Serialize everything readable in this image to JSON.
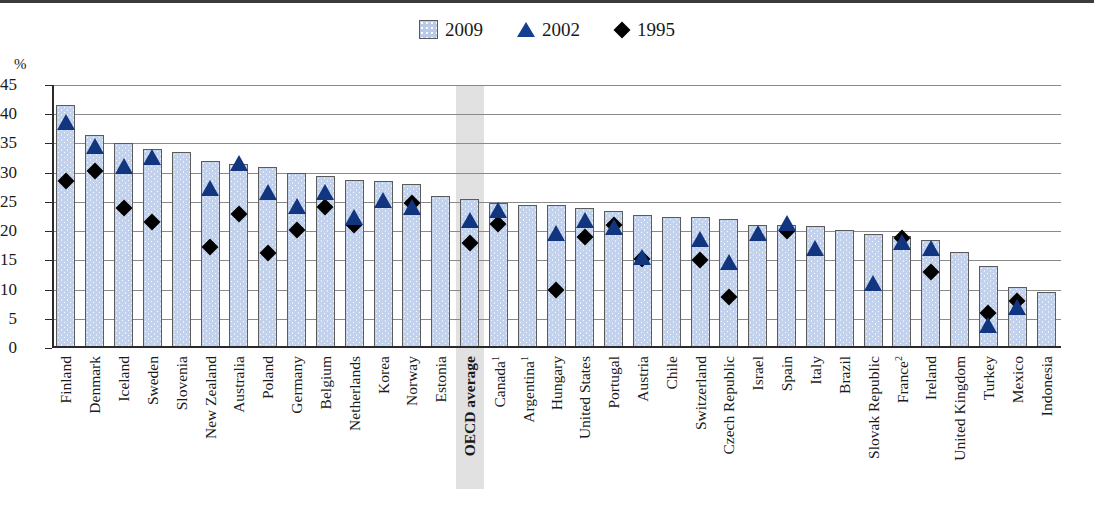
{
  "legend": {
    "items": [
      {
        "label": "2009",
        "icon": "square-swatch-icon",
        "color": "#b9c9e8"
      },
      {
        "label": "2002",
        "icon": "triangle-marker-icon",
        "color": "#11367f"
      },
      {
        "label": "1995",
        "icon": "diamond-marker-icon",
        "color": "#000000"
      }
    ]
  },
  "axis": {
    "y_unit": "%",
    "y_ticks": [
      "0",
      "5",
      "10",
      "15",
      "20",
      "25",
      "30",
      "35",
      "40",
      "45"
    ]
  },
  "highlight": {
    "category": "OECD average",
    "color": "#dcdcdc"
  },
  "chart_data": {
    "type": "bar",
    "title": "",
    "xlabel": "",
    "ylabel": "%",
    "ylim": [
      0,
      45
    ],
    "ytick_step": 5,
    "grid": true,
    "legend_position": "top-center",
    "categories": [
      "Finland",
      "Denmark",
      "Iceland",
      "Sweden",
      "Slovenia",
      "New Zealand",
      "Australia",
      "Poland",
      "Germany",
      "Belgium",
      "Netherlands",
      "Korea",
      "Norway",
      "Estonia",
      "OECD average",
      "Canada¹",
      "Argentina¹",
      "Hungary",
      "United States",
      "Portugal",
      "Austria",
      "Chile",
      "Switzerland",
      "Czech Republic",
      "Israel",
      "Spain",
      "Italy",
      "Brazil",
      "Slovak Republic",
      "France²",
      "Ireland",
      "United Kingdom",
      "Turkey",
      "Mexico",
      "Indonesia"
    ],
    "category_footnotes": {
      "Canada¹": "1",
      "Argentina¹": "1",
      "France²": "2"
    },
    "series": [
      {
        "name": "2009",
        "type": "bar",
        "color": "#c3d2ec",
        "values": [
          41.5,
          36.5,
          35.0,
          34.0,
          33.5,
          32.0,
          31.5,
          31.0,
          30.0,
          29.5,
          28.8,
          28.5,
          28.0,
          26.0,
          25.5,
          24.8,
          24.5,
          24.5,
          24.0,
          23.5,
          22.8,
          22.5,
          22.5,
          22.0,
          21.0,
          21.0,
          20.8,
          20.2,
          19.5,
          19.2,
          18.5,
          16.5,
          14.0,
          10.5,
          9.5
        ]
      },
      {
        "name": "2002",
        "type": "marker-triangle",
        "color": "#11367f",
        "values": [
          39.5,
          35.5,
          32.0,
          33.5,
          null,
          28.2,
          32.5,
          27.5,
          25.2,
          27.5,
          23.3,
          26.2,
          25.0,
          null,
          22.7,
          24.5,
          null,
          20.5,
          22.8,
          21.5,
          16.5,
          null,
          19.5,
          15.5,
          20.5,
          22.2,
          18.0,
          null,
          12.0,
          19.0,
          18.0,
          null,
          4.8,
          7.8,
          null
        ]
      },
      {
        "name": "1995",
        "type": "marker-diamond",
        "color": "#000000",
        "values": [
          28.5,
          30.2,
          24.0,
          21.5,
          null,
          17.2,
          23.0,
          16.2,
          20.2,
          24.2,
          21.0,
          null,
          24.8,
          null,
          18.0,
          21.3,
          null,
          10.0,
          19.0,
          21.0,
          15.3,
          null,
          15.0,
          8.8,
          null,
          20.0,
          null,
          null,
          null,
          18.8,
          13.0,
          null,
          6.0,
          8.0,
          null
        ]
      }
    ]
  }
}
